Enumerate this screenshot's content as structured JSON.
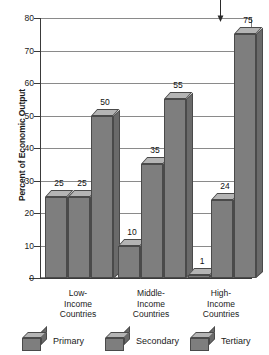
{
  "chart_data": {
    "type": "bar",
    "title": "",
    "xlabel": "",
    "ylabel": "Percent of Economic Output",
    "ylim": [
      0,
      80
    ],
    "ytick_step": 10,
    "yticks": [
      80,
      70,
      60,
      50,
      40,
      30,
      20,
      10,
      0
    ],
    "grid": true,
    "legend_position": "bottom",
    "categories": [
      "Low-\nIncome\nCountries",
      "Middle-\nIncome\nCountries",
      "High-\nIncome\nCountries"
    ],
    "category_lines": [
      [
        "Low-",
        "Income",
        "Countries"
      ],
      [
        "Middle-",
        "Income",
        "Countries"
      ],
      [
        "High-",
        "Income",
        "Countries"
      ]
    ],
    "series": [
      {
        "name": "Primary",
        "values": [
          25,
          10,
          1
        ]
      },
      {
        "name": "Secondary",
        "values": [
          25,
          35,
          24
        ]
      },
      {
        "name": "Tertiary",
        "values": [
          50,
          55,
          75
        ]
      }
    ],
    "annotations": [
      {
        "name": "pointer-arrow",
        "target_value": 75,
        "target_series": "Tertiary",
        "target_category": "High-Income Countries"
      }
    ]
  },
  "colors": {
    "bar_front": "#7e7e7e",
    "bar_top": "#b4b4b4",
    "bar_side": "#6a6a6a",
    "bar_outline": "#4a4a4a",
    "gridline": "#8a8a8a",
    "axis": "#3a3a3a",
    "text": "#1a1a1a",
    "background": "#ffffff"
  }
}
